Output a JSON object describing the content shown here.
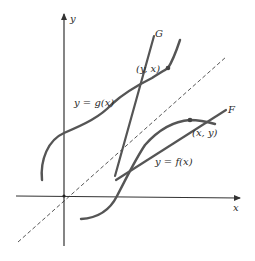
{
  "figure": {
    "axes": {
      "x_label": "x",
      "y_label": "y"
    },
    "curves": {
      "g": {
        "label": "y = g(x)",
        "tangent_label": "G",
        "point_label": "(y, x)"
      },
      "f": {
        "label": "y = f(x)",
        "tangent_label": "F",
        "point_label": "(x, y)"
      }
    },
    "reference_line": {
      "name": "y = x",
      "style": "dashed"
    },
    "colors": {
      "axis": "#333333",
      "curve": "#555555",
      "dashed": "#444444",
      "text": "#2a2a2a"
    }
  }
}
